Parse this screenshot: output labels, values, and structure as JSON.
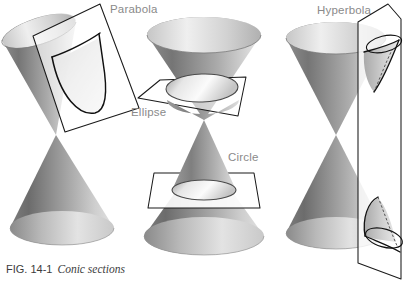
{
  "figure": {
    "caption_number": "FIG. 14-1",
    "caption_text": "Conic sections",
    "background_color": "#ffffff",
    "label_color": "#8a8a8a",
    "outline_color": "#1a1a1a"
  },
  "labels": {
    "parabola": "Parabola",
    "ellipse": "Ellipse",
    "circle": "Circle",
    "hyperbola": "Hyperbola"
  },
  "diagram_data": {
    "type": "geometric-illustration",
    "subject": "conic sections formed by intersecting a plane with a double cone",
    "panels": [
      {
        "name": "parabola-panel",
        "label": "Parabola",
        "cone": "double-nappe cone, axis tilted to the upper-left",
        "cutting_plane": "tilted square plane parallel to one slant side of the cone",
        "section_curve": "parabola",
        "label_position": {
          "x": 110,
          "y": 3
        }
      },
      {
        "name": "ellipse-circle-panel",
        "labels": [
          "Ellipse",
          "Circle"
        ],
        "cone": "double-nappe cone, vertical axis",
        "cutting_planes": [
          {
            "label": "Ellipse",
            "description": "oblique plane through the upper nappe",
            "section_curve": "ellipse"
          },
          {
            "label": "Circle",
            "description": "plane perpendicular to the cone axis through the lower nappe",
            "section_curve": "circle"
          }
        ],
        "label_positions": [
          {
            "x": 131,
            "y": 106
          },
          {
            "x": 228,
            "y": 151
          }
        ]
      },
      {
        "name": "hyperbola-panel",
        "label": "Hyperbola",
        "cone": "double-nappe cone, vertical axis",
        "cutting_plane": "vertical plane parallel to the cone axis cutting both nappes",
        "section_curve": "hyperbola (two branches)",
        "label_position": {
          "x": 317,
          "y": 4
        }
      }
    ],
    "shading": {
      "cone_light": "#d9d9d9",
      "cone_mid": "#a8a8a8",
      "cone_dark": "#6e6e6e",
      "cone_darkest": "#5a5a5a",
      "section_fill_light": "#ededed",
      "section_fill_mid": "#bdbdbd",
      "plane_fill": "#ffffff"
    }
  }
}
